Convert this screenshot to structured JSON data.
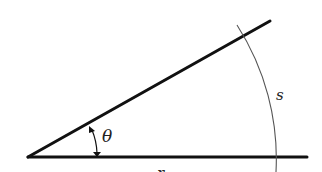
{
  "figure": {
    "colors": {
      "background": "#ffffff",
      "ray": "#111111",
      "arc": "#555555",
      "text": "#222222"
    },
    "labels": {
      "angle": "θ",
      "arc": "s",
      "radius": "r"
    }
  }
}
